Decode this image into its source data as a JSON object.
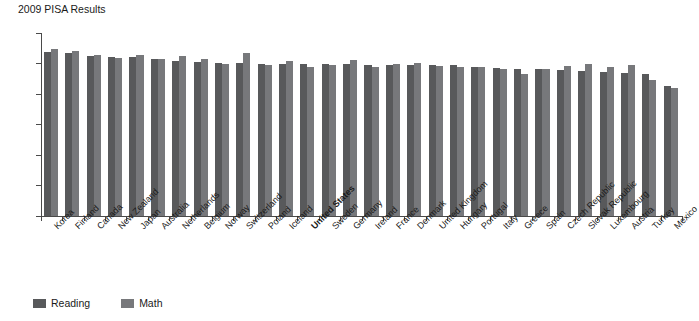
{
  "chart_data": {
    "type": "bar",
    "title": "2009 PISA Results",
    "xlabel": "",
    "ylabel": "",
    "ylim": [
      0,
      600
    ],
    "yticks": [
      0,
      100,
      200,
      300,
      400,
      500,
      600
    ],
    "grid": false,
    "legend_position": "bottom-left",
    "highlight_category": "United States",
    "categories": [
      "Korea",
      "Finland",
      "Canada",
      "New Zealand",
      "Japan",
      "Australia",
      "Netherlands",
      "Belgium",
      "Norway",
      "Switzerland",
      "Poland",
      "Iceland",
      "United States",
      "Sweden",
      "Germany",
      "Ireland",
      "France",
      "Denmark",
      "United Kingdom",
      "Hungary",
      "Portugal",
      "Italy",
      "Greece",
      "Spain",
      "Czech Republic",
      "Slovak Republic",
      "Luxembourg",
      "Austria",
      "Turkey",
      "Mexico"
    ],
    "series": [
      {
        "name": "Reading",
        "color": "#58595b",
        "values": [
          539,
          536,
          524,
          521,
          520,
          515,
          508,
          506,
          503,
          501,
          500,
          500,
          500,
          497,
          497,
          496,
          496,
          495,
          494,
          494,
          489,
          486,
          483,
          481,
          478,
          477,
          472,
          470,
          464,
          425
        ]
      },
      {
        "name": "Math",
        "color": "#77787b",
        "values": [
          546,
          541,
          527,
          519,
          529,
          514,
          526,
          515,
          498,
          534,
          495,
          507,
          487,
          494,
          513,
          487,
          497,
          503,
          492,
          490,
          487,
          483,
          466,
          483,
          493,
          497,
          489,
          496,
          445,
          419
        ]
      }
    ],
    "legend": [
      "Reading",
      "Math"
    ]
  }
}
